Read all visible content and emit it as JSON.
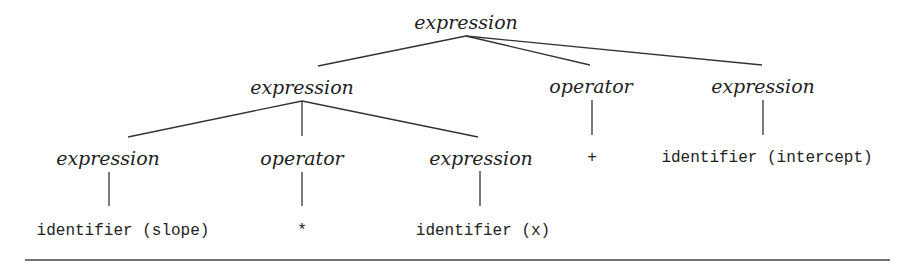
{
  "diagram": {
    "type": "parse-tree",
    "nodes": {
      "root": "expression",
      "l1_left": "expression",
      "l1_mid": "operator",
      "l1_right": "expression",
      "l2_left": "expression",
      "l2_mid": "operator",
      "l2_right": "expression",
      "leaf_slope": "identifier (slope)",
      "leaf_times": "*",
      "leaf_x": "identifier (x)",
      "leaf_plus": "+",
      "leaf_intercept": "identifier (intercept)"
    },
    "edges": [
      [
        "root",
        "l1_left"
      ],
      [
        "root",
        "l1_mid"
      ],
      [
        "root",
        "l1_right"
      ],
      [
        "l1_left",
        "l2_left"
      ],
      [
        "l1_left",
        "l2_mid"
      ],
      [
        "l1_left",
        "l2_right"
      ],
      [
        "l1_mid",
        "leaf_plus"
      ],
      [
        "l1_right",
        "leaf_intercept"
      ],
      [
        "l2_left",
        "leaf_slope"
      ],
      [
        "l2_mid",
        "leaf_times"
      ],
      [
        "l2_right",
        "leaf_x"
      ]
    ]
  }
}
